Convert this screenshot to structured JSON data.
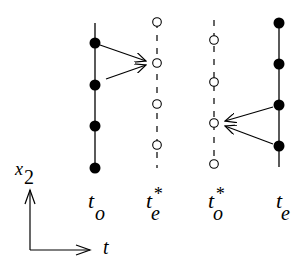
{
  "diagram": {
    "type": "time-grid staggered schematic",
    "columns": [
      {
        "id": "t_o",
        "label": "t",
        "subscript": "o",
        "superscript": "",
        "line": "solid",
        "points": "filled",
        "x": 95,
        "y_points": [
          43,
          85,
          126,
          168
        ]
      },
      {
        "id": "t_e_star",
        "label": "t",
        "subscript": "e",
        "superscript": "*",
        "line": "dashed",
        "points": "hollow",
        "x": 157,
        "y_points": [
          22,
          63,
          104,
          145
        ]
      },
      {
        "id": "t_o_star",
        "label": "t",
        "subscript": "o",
        "superscript": "*",
        "line": "dashed",
        "points": "hollow",
        "x": 214,
        "y_points": [
          40,
          82,
          123,
          164
        ]
      },
      {
        "id": "t_e",
        "label": "t",
        "subscript": "e",
        "superscript": "",
        "line": "solid",
        "points": "filled",
        "x": 279,
        "y_points": [
          23,
          64,
          105,
          146
        ]
      }
    ],
    "arrows": [
      {
        "from": "t_o[0]",
        "to": "t_e_star[1]"
      },
      {
        "from": "t_o[1]",
        "to": "t_e_star[1]"
      },
      {
        "from": "t_e[2]",
        "to": "t_o_star[2]"
      },
      {
        "from": "t_e[3]",
        "to": "t_o_star[2]"
      }
    ],
    "axes": {
      "vertical_label": "x",
      "vertical_subscript": "2",
      "horizontal_label": "t"
    },
    "labels": {
      "t_o": {
        "main": "t",
        "sub": "o",
        "sup": ""
      },
      "t_e_star": {
        "main": "t",
        "sub": "e",
        "sup": "*"
      },
      "t_o_star": {
        "main": "t",
        "sub": "o",
        "sup": "*"
      },
      "t_e": {
        "main": "t",
        "sub": "e",
        "sup": ""
      }
    },
    "colors": {
      "ink": "#000000",
      "background": "#ffffff"
    }
  }
}
